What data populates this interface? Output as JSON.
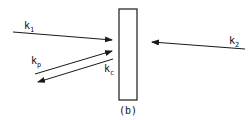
{
  "diagram": {
    "caption": "(b)",
    "wall": {
      "shape": "rectangle"
    },
    "vectors": [
      {
        "id": "k1",
        "base": "k",
        "sub": "1",
        "direction": "toward wall from left"
      },
      {
        "id": "kp",
        "base": "k",
        "sub": "p",
        "direction": "toward wall from lower left"
      },
      {
        "id": "kc",
        "base": "k",
        "sub": "c",
        "direction": "away from wall to lower left"
      },
      {
        "id": "k2",
        "base": "k",
        "sub": "2",
        "direction": "toward wall from right"
      }
    ],
    "colors": {
      "stroke": "#1a1a1a",
      "background": "#ffffff"
    }
  }
}
